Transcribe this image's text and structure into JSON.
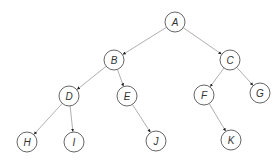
{
  "diagram": {
    "type": "binary-tree",
    "node_radius": 10,
    "colors": {
      "edge": "#9a9a9a",
      "node_stroke": "#555555",
      "label": "#333333",
      "background": "#ffffff"
    },
    "nodes": [
      {
        "id": "A",
        "label": "A",
        "x": 175,
        "y": 22
      },
      {
        "id": "B",
        "label": "B",
        "x": 114,
        "y": 60
      },
      {
        "id": "C",
        "label": "C",
        "x": 230,
        "y": 60
      },
      {
        "id": "D",
        "label": "D",
        "x": 69,
        "y": 96
      },
      {
        "id": "E",
        "label": "E",
        "x": 127,
        "y": 96
      },
      {
        "id": "F",
        "label": "F",
        "x": 204,
        "y": 95
      },
      {
        "id": "G",
        "label": "G",
        "x": 260,
        "y": 93
      },
      {
        "id": "H",
        "label": "H",
        "x": 27,
        "y": 142
      },
      {
        "id": "I",
        "label": "I",
        "x": 74,
        "y": 142
      },
      {
        "id": "J",
        "label": "J",
        "x": 156,
        "y": 141
      },
      {
        "id": "K",
        "label": "K",
        "x": 231,
        "y": 140
      }
    ],
    "edges": [
      {
        "from": "A",
        "to": "B"
      },
      {
        "from": "A",
        "to": "C"
      },
      {
        "from": "B",
        "to": "D"
      },
      {
        "from": "B",
        "to": "E"
      },
      {
        "from": "C",
        "to": "F"
      },
      {
        "from": "C",
        "to": "G"
      },
      {
        "from": "D",
        "to": "H"
      },
      {
        "from": "D",
        "to": "I"
      },
      {
        "from": "E",
        "to": "J"
      },
      {
        "from": "F",
        "to": "K"
      }
    ]
  }
}
